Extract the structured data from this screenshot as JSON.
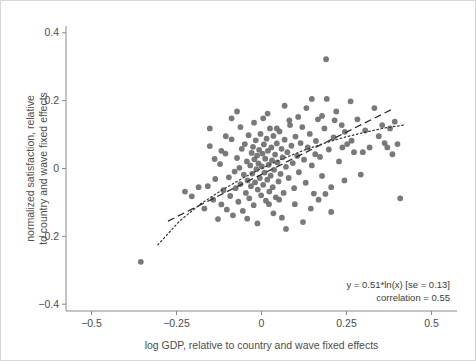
{
  "chart_data": {
    "type": "scatter",
    "title": "",
    "xlabel": "log GDP, relative to country and wave fixed effects",
    "ylabel": "normalized satisfaction, relative to country and wave fixed effects",
    "ylabel_line1": "normalized satisfaction, relative",
    "ylabel_line2": "to country and wave fixed effects",
    "xlim": [
      -0.575,
      0.575
    ],
    "ylim": [
      -0.42,
      0.42
    ],
    "xticks": [
      -0.5,
      -0.25,
      0,
      0.25,
      0.5
    ],
    "xtick_labels": [
      "−0.5",
      "−0.25",
      "0",
      "0.25",
      "0.5"
    ],
    "yticks": [
      -0.4,
      -0.2,
      0,
      0.2,
      0.4
    ],
    "ytick_labels": [
      "−0.4",
      "−0.2",
      "0",
      "0.2",
      "0.4"
    ],
    "grid": false,
    "legend": "none",
    "point_color": "#6e6e6e",
    "point_radius": 2.9,
    "annotations": [
      "y = 0.51*ln(x) [se = 0.13]",
      "correlation = 0.55"
    ],
    "annotation_equation": "y = 0.51*ln(x) [se = 0.13]",
    "annotation_correlation": "correlation = 0.55",
    "fit_lines": [
      {
        "name": "linear-fit",
        "style": "dashed",
        "color": "#2b2b2b",
        "x": [
          -0.275,
          0.385
        ],
        "y": [
          -0.155,
          0.175
        ]
      },
      {
        "name": "log-fit",
        "style": "dotted",
        "color": "#3a3a3a",
        "x": [
          -0.305,
          -0.24,
          -0.18,
          -0.12,
          -0.06,
          0.0,
          0.06,
          0.12,
          0.18,
          0.24,
          0.3,
          0.36,
          0.42
        ],
        "y": [
          -0.225,
          -0.154,
          -0.105,
          -0.066,
          -0.031,
          0.0,
          0.028,
          0.052,
          0.073,
          0.091,
          0.106,
          0.119,
          0.128
        ]
      }
    ],
    "points": [
      [
        -0.355,
        -0.275
      ],
      [
        -0.225,
        -0.068
      ],
      [
        -0.205,
        -0.082
      ],
      [
        -0.185,
        -0.055
      ],
      [
        -0.168,
        -0.118
      ],
      [
        -0.158,
        -0.052
      ],
      [
        -0.152,
        0.066
      ],
      [
        -0.142,
        -0.092
      ],
      [
        -0.136,
        -0.031
      ],
      [
        -0.128,
        -0.149
      ],
      [
        -0.122,
        0.013
      ],
      [
        -0.118,
        -0.106
      ],
      [
        -0.112,
        -0.064
      ],
      [
        -0.106,
        0.044
      ],
      [
        -0.102,
        -0.121
      ],
      [
        -0.096,
        -0.026
      ],
      [
        -0.092,
        -0.081
      ],
      [
        -0.088,
        0.086
      ],
      [
        -0.084,
        -0.138
      ],
      [
        -0.079,
        -0.009
      ],
      [
        -0.076,
        -0.058
      ],
      [
        -0.072,
        0.031
      ],
      [
        -0.068,
        -0.098
      ],
      [
        -0.065,
        0.002
      ],
      [
        -0.062,
        -0.046
      ],
      [
        -0.058,
        0.058
      ],
      [
        -0.055,
        -0.125
      ],
      [
        -0.052,
        -0.018
      ],
      [
        -0.049,
        0.072
      ],
      [
        -0.046,
        -0.072
      ],
      [
        -0.043,
        0.021
      ],
      [
        -0.041,
        -0.035
      ],
      [
        -0.038,
        0.098
      ],
      [
        -0.036,
        -0.088
      ],
      [
        -0.033,
        0.009
      ],
      [
        -0.031,
        -0.052
      ],
      [
        -0.029,
        0.046
      ],
      [
        -0.027,
        -0.015
      ],
      [
        -0.025,
        0.064
      ],
      [
        -0.023,
        -0.108
      ],
      [
        -0.021,
        0.027
      ],
      [
        -0.019,
        -0.041
      ],
      [
        -0.017,
        0.083
      ],
      [
        -0.015,
        -0.002
      ],
      [
        -0.013,
        0.038
      ],
      [
        -0.011,
        -0.062
      ],
      [
        -0.009,
        0.015
      ],
      [
        -0.007,
        0.055
      ],
      [
        -0.005,
        -0.028
      ],
      [
        -0.003,
        0.102
      ],
      [
        -0.001,
        -0.079
      ],
      [
        0.001,
        0.006
      ],
      [
        0.003,
        0.044
      ],
      [
        0.005,
        -0.048
      ],
      [
        0.007,
        0.071
      ],
      [
        0.009,
        -0.012
      ],
      [
        0.011,
        0.029
      ],
      [
        0.013,
        -0.095
      ],
      [
        0.015,
        0.088
      ],
      [
        0.017,
        -0.033
      ],
      [
        0.019,
        0.052
      ],
      [
        0.021,
        0.011
      ],
      [
        0.023,
        -0.068
      ],
      [
        0.025,
        0.118
      ],
      [
        0.027,
        -0.021
      ],
      [
        0.029,
        0.062
      ],
      [
        0.031,
        0.024
      ],
      [
        0.033,
        -0.055
      ],
      [
        0.035,
        0.096
      ],
      [
        0.037,
        -0.004
      ],
      [
        0.04,
        0.041
      ],
      [
        0.042,
        -0.085
      ],
      [
        0.045,
        0.074
      ],
      [
        0.047,
        0.018
      ],
      [
        0.05,
        -0.038
      ],
      [
        0.053,
        0.109
      ],
      [
        0.056,
        -0.016
      ],
      [
        0.059,
        0.058
      ],
      [
        0.062,
        0.033
      ],
      [
        0.065,
        -0.072
      ],
      [
        0.068,
        0.085
      ],
      [
        0.072,
        0.005
      ],
      [
        0.076,
        0.048
      ],
      [
        0.08,
        -0.028
      ],
      [
        0.084,
        0.128
      ],
      [
        0.088,
        0.067
      ],
      [
        0.092,
        0.016
      ],
      [
        0.096,
        -0.058
      ],
      [
        0.1,
        0.094
      ],
      [
        0.105,
        0.037
      ],
      [
        0.11,
        -0.011
      ],
      [
        0.115,
        0.075
      ],
      [
        0.12,
        0.122
      ],
      [
        0.125,
        0.026
      ],
      [
        0.13,
        -0.042
      ],
      [
        0.136,
        0.062
      ],
      [
        0.142,
        0.102
      ],
      [
        0.148,
        0.009
      ],
      [
        0.154,
        -0.074
      ],
      [
        0.16,
        0.081
      ],
      [
        0.166,
        0.145
      ],
      [
        0.172,
        0.034
      ],
      [
        0.178,
        -0.022
      ],
      [
        0.185,
        0.118
      ],
      [
        0.19,
        0.322
      ],
      [
        0.192,
        0.205
      ],
      [
        0.198,
        0.056
      ],
      [
        0.205,
        -0.055
      ],
      [
        0.212,
        0.092
      ],
      [
        0.22,
        0.168
      ],
      [
        0.228,
        0.021
      ],
      [
        0.236,
        0.128
      ],
      [
        0.244,
        -0.035
      ],
      [
        0.252,
        0.072
      ],
      [
        0.262,
        0.198
      ],
      [
        0.272,
        0.048
      ],
      [
        0.282,
        0.145
      ],
      [
        0.292,
        -0.018
      ],
      [
        0.305,
        0.112
      ],
      [
        0.318,
        0.062
      ],
      [
        0.332,
        0.178
      ],
      [
        0.345,
        0.095
      ],
      [
        0.355,
        0.128
      ],
      [
        0.362,
        0.075
      ],
      [
        0.37,
        0.062
      ],
      [
        0.378,
        0.118
      ],
      [
        0.385,
        0.042
      ],
      [
        0.392,
        0.138
      ],
      [
        0.4,
        0.072
      ],
      [
        0.408,
        -0.088
      ],
      [
        0.122,
        -0.158
      ],
      [
        0.06,
        -0.145
      ],
      [
        -0.012,
        -0.162
      ],
      [
        0.145,
        -0.118
      ],
      [
        0.072,
        -0.178
      ],
      [
        0.035,
        -0.132
      ],
      [
        -0.042,
        -0.148
      ],
      [
        0.098,
        -0.105
      ],
      [
        0.168,
        -0.092
      ],
      [
        0.205,
        -0.128
      ],
      [
        -0.152,
        0.118
      ],
      [
        -0.088,
        0.148
      ],
      [
        0.018,
        0.162
      ],
      [
        0.068,
        0.185
      ],
      [
        0.108,
        0.152
      ],
      [
        0.148,
        0.205
      ],
      [
        -0.022,
        0.135
      ],
      [
        -0.118,
        0.052
      ],
      [
        0.245,
        0.108
      ],
      [
        0.298,
        0.048
      ],
      [
        -0.062,
        0.122
      ],
      [
        0.082,
        0.142
      ],
      [
        0.132,
        0.178
      ],
      [
        0.215,
        0.142
      ],
      [
        0.265,
        0.082
      ],
      [
        -0.105,
        0.095
      ],
      [
        0.005,
        0.148
      ],
      [
        0.045,
        0.118
      ],
      [
        0.178,
        0.155
      ],
      [
        0.238,
        0.062
      ],
      [
        -0.072,
        0.168
      ],
      [
        0.022,
        -0.105
      ],
      [
        -0.138,
        0.028
      ],
      [
        0.158,
        0.042
      ],
      [
        0.188,
        -0.075
      ],
      [
        0.052,
        -0.092
      ]
    ]
  }
}
